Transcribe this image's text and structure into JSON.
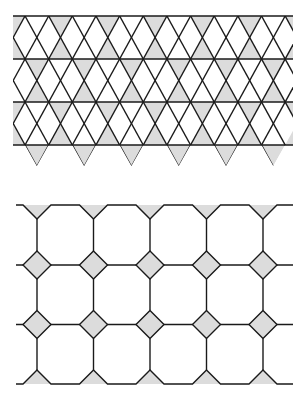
{
  "figure": {
    "colors": {
      "line": "#1a1a1a",
      "shade": "#dcdcdc",
      "background": "#ffffff"
    },
    "patterns": [
      {
        "name": "trihexagonal-tiling",
        "label": "Triangles and hexagons (kagome)",
        "region": {
          "x0": 13,
          "x1": 293,
          "y_lines": [
            16,
            59,
            102,
            145
          ],
          "y_bottom_tips": 166
        },
        "period_x": 47.3,
        "cross_x_row_a": 60.5,
        "cross_x_row_b": 36.8,
        "shaded": "triangles"
      },
      {
        "name": "truncated-square-tiling",
        "label": "Octagons and squares",
        "region": {
          "x0": 16,
          "x1": 293,
          "y_top": 205,
          "y_bottom": 384
        },
        "columns_x": [
          37,
          93.5,
          150,
          206.5,
          263
        ],
        "diamond_rows_y": [
          265,
          324.5
        ],
        "diamond_half": 14,
        "edge_notch_depth": 14,
        "shaded": "squares"
      }
    ]
  }
}
